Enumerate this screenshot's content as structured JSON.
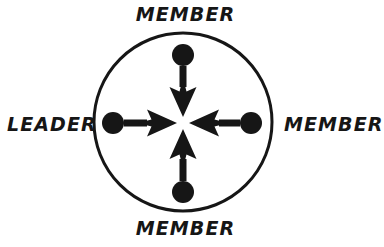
{
  "figure": {
    "kind": "communication-network-diagram",
    "background_color": "#ffffff",
    "ink_color": "#161616"
  },
  "boundary": {
    "shape_name": "group-boundary-circle",
    "center_x": 183,
    "center_y": 122,
    "radius": 89,
    "stroke_width": 3,
    "stroke_color": "#161616",
    "fill": "none"
  },
  "center_hub": {
    "x": 183,
    "y": 123,
    "gap_radius": 6
  },
  "nodes": [
    {
      "id": "top",
      "role_label": "MEMBER",
      "dot_x": 183,
      "dot_y": 55,
      "dot_radius": 11,
      "fill_color": "#161616",
      "label_position": "above"
    },
    {
      "id": "left",
      "role_label": "LEADER",
      "dot_x": 113,
      "dot_y": 123,
      "dot_radius": 11,
      "fill_color": "#161616",
      "label_position": "left"
    },
    {
      "id": "right",
      "role_label": "MEMBER",
      "dot_x": 251,
      "dot_y": 123,
      "dot_radius": 11,
      "fill_color": "#161616",
      "label_position": "right"
    },
    {
      "id": "bottom",
      "role_label": "MEMBER",
      "dot_x": 183,
      "dot_y": 192,
      "dot_radius": 11,
      "fill_color": "#161616",
      "label_position": "below"
    }
  ],
  "arrows": [
    {
      "id": "arrow-top-to-center",
      "direction": "down",
      "from_node": "top",
      "to": "center",
      "shaft_width": 7,
      "head_width": 27,
      "head_length": 30,
      "color": "#161616"
    },
    {
      "id": "arrow-left-to-center",
      "direction": "right",
      "from_node": "left",
      "to": "center",
      "shaft_width": 7,
      "head_width": 27,
      "head_length": 30,
      "color": "#161616"
    },
    {
      "id": "arrow-right-to-center",
      "direction": "left",
      "from_node": "right",
      "to": "center",
      "shaft_width": 7,
      "head_width": 27,
      "head_length": 30,
      "color": "#161616"
    },
    {
      "id": "arrow-bottom-to-center",
      "direction": "up",
      "from_node": "bottom",
      "to": "center",
      "shaft_width": 7,
      "head_width": 27,
      "head_length": 30,
      "color": "#161616"
    }
  ],
  "labels": {
    "top": "MEMBER",
    "left": "LEADER",
    "right": "MEMBER",
    "bottom": "MEMBER"
  }
}
